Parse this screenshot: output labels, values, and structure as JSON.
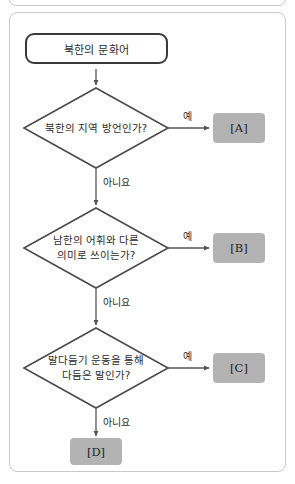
{
  "diagram": {
    "type": "flowchart",
    "title_node": {
      "label": "북한의 문화어"
    },
    "decisions": [
      {
        "id": "d1",
        "lines": [
          "북한의 지역 방언인가?"
        ],
        "yes_label": "예",
        "no_label": "아니요",
        "yes_target": "[A]"
      },
      {
        "id": "d2",
        "lines": [
          "남한의 어휘와 다른",
          "의미로 쓰이는가?"
        ],
        "yes_label": "예",
        "no_label": "아니요",
        "yes_target": "[B]"
      },
      {
        "id": "d3",
        "lines": [
          "말다듬기 운동을 통해",
          "다듬은 말인가?"
        ],
        "yes_label": "예",
        "no_label": "아니요",
        "yes_target": "[C]"
      }
    ],
    "terminals": [
      {
        "id": "a",
        "label": "[A]"
      },
      {
        "id": "b",
        "label": "[B]"
      },
      {
        "id": "c",
        "label": "[C]"
      },
      {
        "id": "d",
        "label": "[D]"
      }
    ],
    "colors": {
      "terminal_fill": "#b3b3b3",
      "stroke_dark": "#3a3a3a",
      "stroke_mid": "#555555",
      "frame_border": "#c9c9c9",
      "text": "#2b2b2b"
    }
  }
}
